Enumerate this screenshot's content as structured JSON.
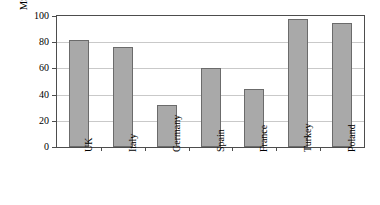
{
  "chart_data": {
    "type": "bar",
    "title": "",
    "subtitle": "",
    "xlabel": "",
    "ylabel": "MSW Landfilled (%)",
    "categories": [
      "UK",
      "Italy",
      "Germany",
      "Spain",
      "France",
      "Turkey",
      "Poland"
    ],
    "values": [
      82,
      76,
      32,
      60,
      44,
      98,
      95
    ],
    "ylim": [
      0,
      100
    ],
    "yticks": [
      0,
      20,
      40,
      60,
      80,
      100
    ],
    "ytick_labels": [
      "0",
      "20",
      "40",
      "60",
      "80",
      "100"
    ],
    "grid": true,
    "grid_axis": "y",
    "legend": false,
    "legend_position": "none",
    "bar_color": "#a9a9a9",
    "bar_edge_color": "#6b6b6b",
    "grid_color": "#c9c9c9",
    "axis_color": "#4d4d4d",
    "background_color": "#ffffff",
    "xtick_rotation": 90
  }
}
